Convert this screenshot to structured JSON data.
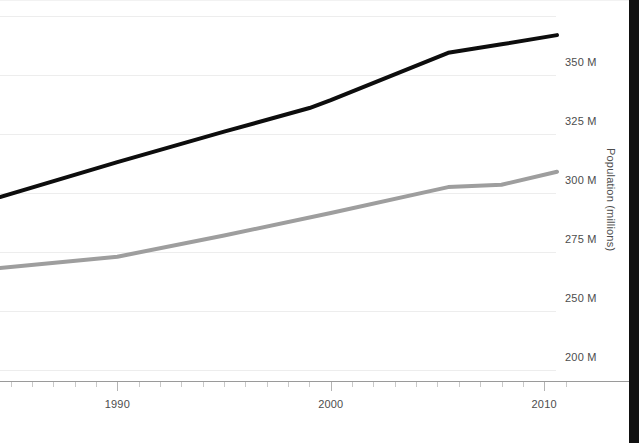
{
  "chart_data": {
    "type": "line",
    "title": "",
    "xlabel": "",
    "ylabel": "Population (millions)",
    "xlim": [
      1984.5,
      2010.6
    ],
    "ylim": [
      225,
      375
    ],
    "grid": true,
    "legend": "none",
    "y_ticks": [
      {
        "value": 350,
        "label": "350 M"
      },
      {
        "value": 325,
        "label": "325 M"
      },
      {
        "value": 300,
        "label": "300 M"
      },
      {
        "value": 275,
        "label": "275 M"
      },
      {
        "value": 250,
        "label": "250 M"
      },
      {
        "value": 225,
        "label": "200 M"
      }
    ],
    "x_ticks": [
      {
        "value": 1990,
        "label": "1990"
      },
      {
        "value": 2000,
        "label": "2000"
      },
      {
        "value": 2010,
        "label": "2010"
      }
    ],
    "x_minor_step": 1,
    "series": [
      {
        "name": "upper-series",
        "color": "#0d0d0d",
        "width": 4,
        "points": [
          {
            "x": 1984.5,
            "y": 298.3
          },
          {
            "x": 1990.0,
            "y": 313.1
          },
          {
            "x": 1995.0,
            "y": 326.0
          },
          {
            "x": 1999.0,
            "y": 336.0
          },
          {
            "x": 2000.0,
            "y": 339.4
          },
          {
            "x": 2005.5,
            "y": 359.4
          },
          {
            "x": 2008.0,
            "y": 363.0
          },
          {
            "x": 2010.6,
            "y": 366.9
          }
        ]
      },
      {
        "name": "lower-series",
        "color": "#9e9e9e",
        "width": 4,
        "points": [
          {
            "x": 1984.5,
            "y": 268.2
          },
          {
            "x": 1990.0,
            "y": 273.0
          },
          {
            "x": 1995.0,
            "y": 282.0
          },
          {
            "x": 2000.0,
            "y": 291.5
          },
          {
            "x": 2005.5,
            "y": 302.5
          },
          {
            "x": 2008.0,
            "y": 303.5
          },
          {
            "x": 2010.6,
            "y": 309.0
          }
        ]
      }
    ]
  }
}
